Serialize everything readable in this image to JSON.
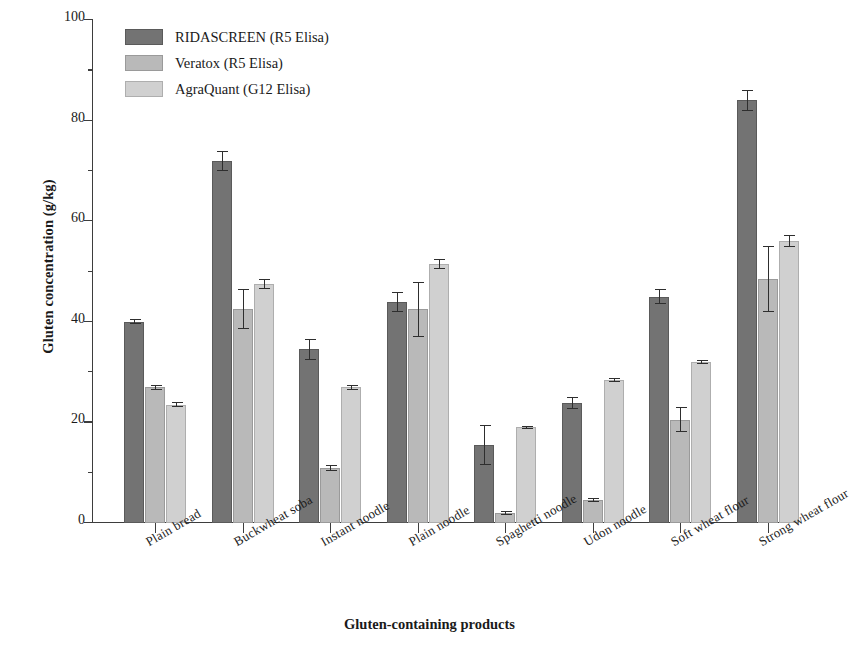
{
  "chart_data": {
    "type": "bar",
    "title": "",
    "xlabel": "Gluten-containing products",
    "ylabel": "Gluten concentration (g/kg)",
    "ylim": [
      0,
      100
    ],
    "yticks": [
      0,
      20,
      40,
      60,
      80,
      100
    ],
    "yticks_minor": [
      10,
      30,
      50,
      70,
      90
    ],
    "grid": false,
    "legend_position": "top-left",
    "categories": [
      "Plain bread",
      "Buckwheat soba",
      "Instant noodle",
      "Plain noodle",
      "Spaghetti noodle",
      "Udon noodle",
      "Soft wheat flour",
      "Strong wheat flour"
    ],
    "series": [
      {
        "name": "RIDASCREEN (R5 Elisa)",
        "color": "#737373",
        "values": [
          40.0,
          72.0,
          34.5,
          44.0,
          15.5,
          23.8,
          45.0,
          84.0
        ],
        "errors": [
          0.5,
          2.0,
          2.0,
          2.0,
          4.0,
          1.2,
          1.5,
          2.0
        ]
      },
      {
        "name": "Veratox (R5 Elisa)",
        "color": "#b9b9b9",
        "values": [
          27.0,
          42.5,
          11.0,
          42.5,
          2.0,
          4.5,
          20.5,
          48.5
        ],
        "errors": [
          0.5,
          4.0,
          0.6,
          5.5,
          0.4,
          0.4,
          2.5,
          6.5
        ]
      },
      {
        "name": "AgraQuant (G12 Elisa)",
        "color": "#d0d0d0",
        "values": [
          23.5,
          47.5,
          27.0,
          51.5,
          19.0,
          28.5,
          32.0,
          56.0
        ],
        "errors": [
          0.5,
          1.0,
          0.5,
          1.0,
          0.3,
          0.4,
          0.4,
          1.2
        ]
      }
    ]
  },
  "axis": {
    "y_label": "Gluten concentration (g/kg)",
    "x_label": "Gluten-containing products",
    "y_tick_labels": [
      "0",
      "20",
      "40",
      "60",
      "80",
      "100"
    ]
  },
  "legend": {
    "items": [
      {
        "label": "RIDASCREEN (R5 Elisa)",
        "swatch": "dark-gray-swatch"
      },
      {
        "label": "Veratox (R5 Elisa)",
        "swatch": "medium-gray-swatch"
      },
      {
        "label": "AgraQuant (G12 Elisa)",
        "swatch": "light-gray-swatch"
      }
    ]
  }
}
